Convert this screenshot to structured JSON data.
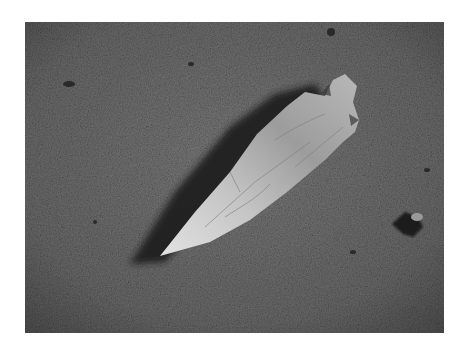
{
  "image": {
    "alt": "Grayscale photograph of a chipped stone arrowhead lying on sandy ground, casting a shadow to the upper left",
    "subject": "arrowhead",
    "colors": {
      "sand": "#6e6e6e",
      "sand_dark": "#4a4a4a",
      "stone_light": "#d6d6d6",
      "stone_mid": "#9a9a9a",
      "shadow": "#1e1e1e",
      "background": "#ffffff"
    }
  }
}
